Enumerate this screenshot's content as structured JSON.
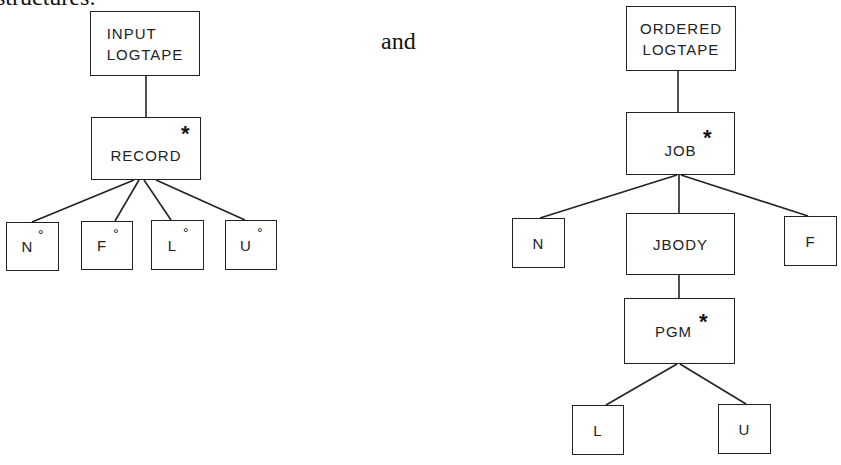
{
  "text": {
    "caption_fragment": "structures:",
    "connector_word": "and"
  },
  "left_tree": {
    "root": {
      "label": "INPUT\nLOGTAPE"
    },
    "iter": {
      "label": "RECORD",
      "marker": "*"
    },
    "leaves": [
      {
        "label": "N",
        "marker": "°"
      },
      {
        "label": "F",
        "marker": "°"
      },
      {
        "label": "L",
        "marker": "°"
      },
      {
        "label": "U",
        "marker": "°"
      }
    ]
  },
  "right_tree": {
    "root": {
      "label": "ORDERED\nLOGTAPE"
    },
    "iter": {
      "label": "JOB",
      "marker": "*"
    },
    "children": [
      {
        "label": "N"
      },
      {
        "label": "JBODY"
      },
      {
        "label": "F"
      }
    ],
    "sub_iter": {
      "label": "PGM",
      "marker": "*"
    },
    "sub_leaves": [
      {
        "label": "L"
      },
      {
        "label": "U"
      }
    ]
  }
}
